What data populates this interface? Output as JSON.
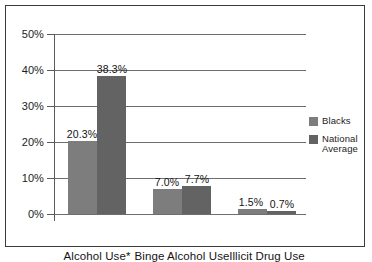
{
  "chart_data": {
    "type": "bar",
    "title": "",
    "xlabel": "",
    "ylabel": "",
    "ylim": [
      0,
      50
    ],
    "yticks": [
      "0%",
      "10%",
      "20%",
      "30%",
      "40%",
      "50%"
    ],
    "ytick_values": [
      0,
      10,
      20,
      30,
      40,
      50
    ],
    "grid": true,
    "legend_position": "right",
    "categories": [
      "Alcohol Use*",
      "Binge Alcohol Use",
      "Illicit Drug Use"
    ],
    "series": [
      {
        "name": "Blacks",
        "color": "#7d7d7d",
        "values": [
          20.3,
          7.0,
          1.5
        ],
        "labels": [
          "20.3%",
          "7.0%",
          "1.5%"
        ]
      },
      {
        "name": "National Average",
        "color": "#636363",
        "values": [
          38.3,
          7.7,
          0.7
        ],
        "labels": [
          "38.3%",
          "7.7%",
          "0.7%"
        ]
      }
    ]
  },
  "legend": {
    "items": [
      {
        "label": "Blacks",
        "line1": "Blacks",
        "line2": "",
        "color": "#7d7d7d"
      },
      {
        "label": "National Average",
        "line1": "National",
        "line2": "Average",
        "color": "#636363"
      }
    ]
  },
  "axis": {
    "y_tick_labels": [
      "50%",
      "40%",
      "30%",
      "20%",
      "10%",
      "0%"
    ]
  }
}
